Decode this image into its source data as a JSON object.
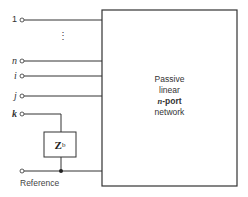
{
  "diagram": {
    "network_box": {
      "line1": "Passive",
      "line2": "linear",
      "line3_var": "n",
      "line3_rest": "-port",
      "line4": "network"
    },
    "terminals": [
      {
        "label": "1",
        "italic": false
      },
      {
        "label": "n",
        "italic": true
      },
      {
        "label": "i",
        "italic": true
      },
      {
        "label": "j",
        "italic": true
      },
      {
        "label": "k",
        "italic": true
      }
    ],
    "ellipsis": "⋮",
    "impedance": {
      "symbol": "Z",
      "subscript": "b"
    },
    "reference_label": "Reference",
    "colors": {
      "line": "#333333",
      "text": "#333333"
    }
  }
}
